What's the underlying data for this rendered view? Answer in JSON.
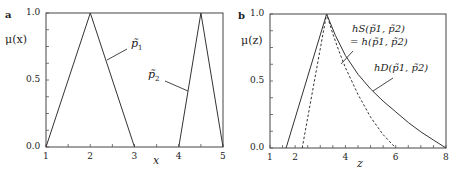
{
  "chart_data": [
    {
      "panel": "a",
      "type": "line",
      "xlabel": "x",
      "ylabel": "μ(x)",
      "xlim": [
        1,
        5
      ],
      "ylim": [
        0,
        1
      ],
      "xticks": [
        "1",
        "2",
        "3",
        "4",
        "5"
      ],
      "yticks": [
        "0.0",
        "0.5",
        "1.0"
      ],
      "grid": false,
      "series": [
        {
          "name": "p̃1",
          "style": "solid",
          "x": [
            1,
            2,
            3
          ],
          "y": [
            0,
            1,
            0
          ]
        },
        {
          "name": "p̃2",
          "style": "solid",
          "x": [
            4,
            4.5,
            5
          ],
          "y": [
            0,
            1,
            0
          ]
        }
      ],
      "annotations": [
        "p̃1",
        "p̃2"
      ]
    },
    {
      "panel": "b",
      "type": "line",
      "xlabel": "z",
      "ylabel": "μ(z)",
      "xlim": [
        1,
        8
      ],
      "ylim": [
        0,
        1
      ],
      "xticks": [
        "1",
        "2",
        "4",
        "6",
        "8"
      ],
      "yticks": [
        "0.0",
        "0.5",
        "1.0"
      ],
      "grid": false,
      "series": [
        {
          "name": "hD(p̃1,p̃2)",
          "style": "solid",
          "x": [
            1.64,
            3.25,
            3.6,
            4.0,
            4.5,
            5.0,
            5.5,
            6.0,
            6.5,
            7.0,
            7.5,
            8.0
          ],
          "y": [
            0,
            1,
            0.84,
            0.69,
            0.55,
            0.44,
            0.35,
            0.27,
            0.19,
            0.12,
            0.06,
            0
          ]
        },
        {
          "name": "hS(p̃1,p̃2) = h(p̃1,p̃2)",
          "style": "dashed",
          "x": [
            2.28,
            3.25,
            3.5,
            3.75,
            4.0,
            4.5,
            5.0,
            5.5,
            6.0
          ],
          "y": [
            0,
            1,
            0.85,
            0.72,
            0.6,
            0.4,
            0.23,
            0.1,
            0
          ]
        }
      ],
      "annotations": [
        "hS(p̃1,p̃2)",
        "= h(p̃1,p̃2)",
        "hD(p̃1,p̃2)"
      ]
    }
  ],
  "labels": {
    "panel_a": "a",
    "panel_b": "b",
    "a_ylabel": "μ(x)",
    "a_xlabel": "x",
    "b_ylabel": "μ(z)",
    "b_xlabel": "z",
    "p1": "p̃",
    "p1_sub": "1",
    "p2": "p̃",
    "p2_sub": "2",
    "hs_line1": "hS(p̃1, p̃2)",
    "hs_line2": "= h(p̃1, p̃2)",
    "hd": "hD(p̃1, p̃2)"
  }
}
